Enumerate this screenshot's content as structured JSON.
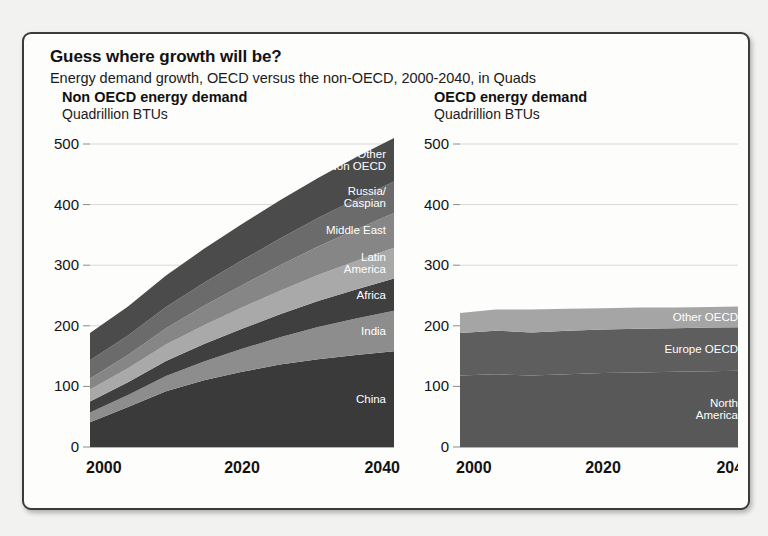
{
  "header": {
    "title": "Guess where growth will be?",
    "subtitle": "Energy demand growth, OECD versus the non-OECD, 2000-2040, in Quads"
  },
  "panels": {
    "left": {
      "title": "Non OECD energy demand",
      "units": "Quadrillion BTUs"
    },
    "right": {
      "title": "OECD energy demand",
      "units": "Quadrillion BTUs"
    }
  },
  "chart_data": [
    {
      "type": "area",
      "id": "non-oecd",
      "title": "Non OECD energy demand",
      "ylabel": "Quadrillion BTUs",
      "xlabel": "",
      "ylim": [
        0,
        500
      ],
      "xlim": [
        2000,
        2040
      ],
      "yticks": [
        0,
        100,
        200,
        300,
        400,
        500
      ],
      "xticks": [
        2000,
        2020,
        2040
      ],
      "grid": true,
      "legend": "inline-labels",
      "stacked": true,
      "x": [
        2000,
        2005,
        2010,
        2015,
        2020,
        2025,
        2030,
        2035,
        2040
      ],
      "series": [
        {
          "name": "China",
          "color": "#3a3a3a",
          "values": [
            41,
            66,
            92,
            110,
            124,
            136,
            145,
            152,
            158
          ]
        },
        {
          "name": "India",
          "color": "#8d8d8d",
          "values": [
            16,
            20,
            25,
            31,
            38,
            45,
            53,
            60,
            67
          ]
        },
        {
          "name": "Africa",
          "color": "#3f3f3f",
          "values": [
            18,
            21,
            25,
            29,
            33,
            38,
            43,
            48,
            53
          ]
        },
        {
          "name": "Latin America",
          "color": "#a9a9a9",
          "values": [
            20,
            23,
            27,
            31,
            35,
            39,
            43,
            47,
            51
          ]
        },
        {
          "name": "Middle East",
          "color": "#868686",
          "values": [
            18,
            22,
            27,
            32,
            37,
            42,
            47,
            52,
            57
          ]
        },
        {
          "name": "Russia/Caspian",
          "color": "#6b6b6b",
          "values": [
            30,
            32,
            35,
            38,
            41,
            44,
            47,
            50,
            52
          ]
        },
        {
          "name": "Other Non OECD",
          "color": "#4b4b4b",
          "values": [
            45,
            48,
            52,
            56,
            60,
            63,
            66,
            69,
            72
          ]
        }
      ],
      "totals": [
        188,
        232,
        283,
        327,
        368,
        407,
        444,
        478,
        510
      ]
    },
    {
      "type": "area",
      "id": "oecd",
      "title": "OECD energy demand",
      "ylabel": "Quadrillion BTUs",
      "xlabel": "",
      "ylim": [
        0,
        500
      ],
      "xlim": [
        2000,
        2040
      ],
      "yticks": [
        0,
        100,
        200,
        300,
        400,
        500
      ],
      "xticks": [
        2000,
        2020,
        2040
      ],
      "grid": true,
      "legend": "inline-labels",
      "stacked": true,
      "x": [
        2000,
        2005,
        2010,
        2015,
        2020,
        2025,
        2030,
        2035,
        2040
      ],
      "series": [
        {
          "name": "North America",
          "color": "#585858",
          "values": [
            118,
            120,
            118,
            120,
            122,
            123,
            124,
            125,
            126
          ]
        },
        {
          "name": "Europe OECD",
          "color": "#5e5e5e",
          "values": [
            70,
            72,
            71,
            72,
            72,
            72,
            72,
            72,
            72
          ]
        },
        {
          "name": "Other OECD",
          "color": "#a5a5a5",
          "values": [
            33,
            35,
            38,
            36,
            35,
            35,
            34,
            34,
            34
          ]
        }
      ],
      "totals": [
        221,
        227,
        227,
        228,
        229,
        230,
        230,
        231,
        232
      ]
    }
  ],
  "axis": {
    "yticks": [
      "0",
      "100",
      "200",
      "300",
      "400",
      "500"
    ],
    "xticks": [
      "2000",
      "2020",
      "2040"
    ]
  },
  "band_labels": {
    "left": [
      "Other Non OECD",
      "Russia/ Caspian",
      "Middle East",
      "Latin America",
      "Africa",
      "India",
      "China"
    ],
    "right": [
      "Other OECD",
      "Europe OECD",
      "North America"
    ]
  },
  "colors": {
    "frame": "#3b3b3b",
    "page_bg": "#f2f2f0",
    "panel_bg": "#fdfdfc",
    "grid": "#d8d8d8",
    "text": "#121212"
  }
}
